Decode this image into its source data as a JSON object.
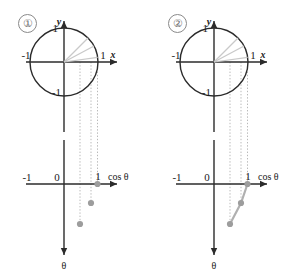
{
  "figure": {
    "colors": {
      "axis": "#2b2b2b",
      "circle": "#2b2b2b",
      "ray": "#c9c9c9",
      "dotted_guide": "#b9b9b9",
      "marker": "#9d9d9d",
      "segment": "#b0b0b0",
      "badge_border": "#8a8a8a",
      "badge_text": "#6d6d6d",
      "background": "#ffffff"
    },
    "panels": [
      {
        "badge": "①",
        "circle_plot": {
          "x_axis_label": "x",
          "y_axis_label": "y",
          "x_ticks": [
            "-1",
            "1"
          ],
          "y_ticks": [
            "1",
            "-1"
          ],
          "radius_value": 1,
          "rays": [
            {
              "angle_deg": 45,
              "cos": 0.71
            },
            {
              "angle_deg": 28,
              "cos": 0.88
            },
            {
              "angle_deg": 8,
              "cos": 0.99
            }
          ]
        },
        "cos_plot": {
          "x_axis_label": "cos θ",
          "y_axis_label": "θ",
          "x_ticks": [
            "-1",
            "0",
            "1"
          ],
          "points": [
            {
              "cos": 0.99,
              "theta_deg": 8
            },
            {
              "cos": 0.88,
              "theta_deg": 28
            },
            {
              "cos": 0.71,
              "theta_deg": 45
            }
          ],
          "points_connected": false
        }
      },
      {
        "badge": "②",
        "circle_plot": {
          "x_axis_label": "x",
          "y_axis_label": "y",
          "x_ticks": [
            "-1",
            "1"
          ],
          "y_ticks": [
            "1",
            "-1"
          ],
          "radius_value": 1,
          "rays": [
            {
              "angle_deg": 45,
              "cos": 0.71
            },
            {
              "angle_deg": 28,
              "cos": 0.88
            },
            {
              "angle_deg": 8,
              "cos": 0.99
            }
          ]
        },
        "cos_plot": {
          "x_axis_label": "cos θ",
          "y_axis_label": "θ",
          "x_ticks": [
            "-1",
            "0",
            "1"
          ],
          "points": [
            {
              "cos": 0.99,
              "theta_deg": 8
            },
            {
              "cos": 0.88,
              "theta_deg": 28
            },
            {
              "cos": 0.71,
              "theta_deg": 45
            }
          ],
          "points_connected": true
        }
      }
    ]
  }
}
